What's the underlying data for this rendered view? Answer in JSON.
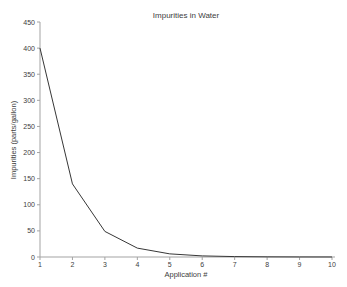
{
  "chart_data": {
    "type": "line",
    "title": "Impurities in Water",
    "xlabel": "Application #",
    "ylabel": "Impurities (parts/gallon)",
    "x": [
      1,
      2,
      3,
      4,
      5,
      6,
      7,
      8,
      9,
      10
    ],
    "values": [
      400,
      140,
      49,
      17,
      6,
      2.1,
      0.8,
      0.3,
      0.1,
      0.04
    ],
    "xlim": [
      1,
      10
    ],
    "ylim": [
      0,
      450
    ],
    "xticks": [
      1,
      2,
      3,
      4,
      5,
      6,
      7,
      8,
      9,
      10
    ],
    "yticks": [
      0,
      50,
      100,
      150,
      200,
      250,
      300,
      350,
      400,
      450
    ],
    "grid": false,
    "legend_position": "none",
    "line_color": "#373737",
    "axis_color": "#a3a3a3",
    "text_color": "#404040",
    "background_color": "#ffffff"
  }
}
